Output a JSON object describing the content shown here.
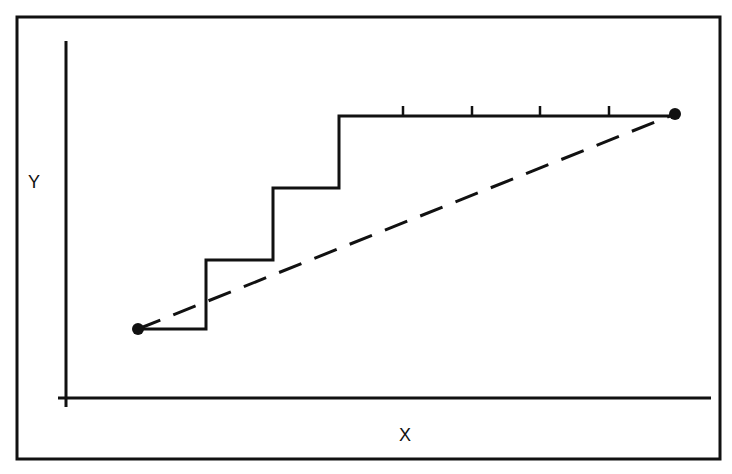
{
  "diagram": {
    "type": "staircase-vs-linear-path",
    "colors": {
      "background": "#ffffff",
      "stroke": "#111111",
      "frame": "#111111"
    },
    "labels": {
      "y_axis": "Y",
      "x_axis": "X"
    },
    "frame": {
      "x": 17,
      "y": 17,
      "width": 703,
      "height": 442
    },
    "axes": {
      "y_axis": {
        "x": 66,
        "y1": 41,
        "y2": 407
      },
      "x_axis": {
        "y": 398,
        "x1": 58,
        "x2": 711
      }
    },
    "start_point": {
      "x": 138,
      "y": 329
    },
    "end_point": {
      "x": 675,
      "y": 114
    },
    "staircase_path": [
      [
        138,
        329
      ],
      [
        206,
        329
      ],
      [
        206,
        260
      ],
      [
        273,
        260
      ],
      [
        273,
        188
      ],
      [
        339,
        188
      ],
      [
        339,
        116
      ],
      [
        675,
        116
      ]
    ],
    "ticks_on_top_segment": [
      403,
      472,
      540,
      609
    ],
    "dashed_line": {
      "from": [
        138,
        329
      ],
      "to": [
        675,
        114
      ],
      "dash_pattern": "24 14"
    }
  }
}
